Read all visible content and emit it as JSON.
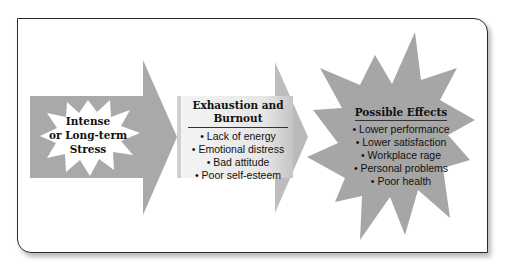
{
  "diagram": {
    "colors": {
      "frame_border": "#2b2b2b",
      "arrow_gray": "#a9a9a9",
      "star_gray": "#a6a6a6",
      "star_white": "#ffffff",
      "burnout_box_light": "#f2f2f2"
    },
    "stage1": {
      "label_line1": "Intense",
      "label_line2": "or Long-term",
      "label_line3": "Stress"
    },
    "stage2": {
      "title_line1": "Exhaustion and",
      "title_line2": "Burnout",
      "items": [
        "• Lack of energy",
        "• Emotional distress",
        "• Bad attitude",
        "• Poor self-esteem"
      ]
    },
    "stage3": {
      "title": "Possible Effects",
      "items": [
        "• Lower performance",
        "• Lower satisfaction",
        "• Workplace rage",
        "• Personal problems",
        "• Poor health"
      ]
    }
  }
}
